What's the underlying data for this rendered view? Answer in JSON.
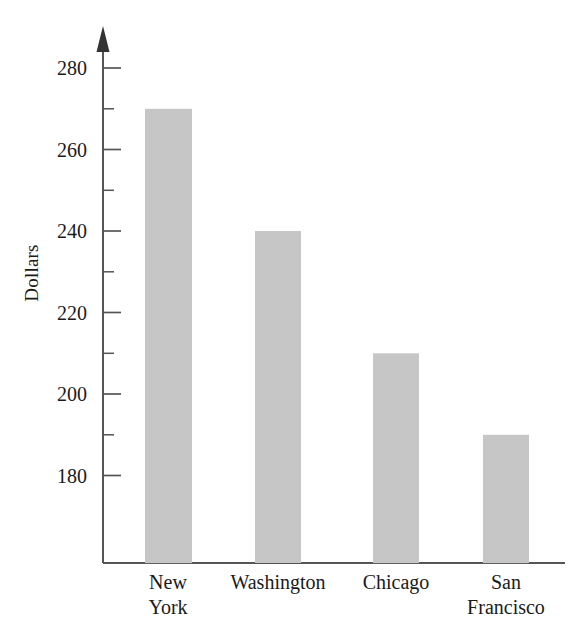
{
  "chart_data": {
    "type": "bar",
    "title": "",
    "subtitle": "",
    "xlabel": "",
    "ylabel": "Dollars",
    "categories": [
      "New York",
      "Washington",
      "Chicago",
      "San Francisco"
    ],
    "values": [
      270,
      240,
      210,
      190
    ],
    "ylim": [
      170,
      285
    ],
    "y_major_ticks": [
      180,
      200,
      220,
      240,
      260,
      280
    ],
    "y_minor_ticks": [
      190,
      210,
      230,
      250,
      270
    ],
    "y_tick_labels": [
      "180",
      "200",
      "220",
      "240",
      "260",
      "280"
    ],
    "grid": false,
    "legend": false,
    "legend_position": "none",
    "bar_color": "#c6c6c6",
    "axis_color": "#555555",
    "text_color": "#1a1a1a",
    "background_color": "#ffffff",
    "axis_arrow": true,
    "category_label_lines": [
      [
        "New",
        "York"
      ],
      [
        "Washington"
      ],
      [
        "Chicago"
      ],
      [
        "San",
        "Francisco"
      ]
    ]
  },
  "axis": {
    "y_title": "Dollars",
    "tick_280": "280",
    "tick_260": "260",
    "tick_240": "240",
    "tick_220": "220",
    "tick_200": "200",
    "tick_180": "180"
  },
  "categories": {
    "c0_line0": "New",
    "c0_line1": "York",
    "c1_line0": "Washington",
    "c2_line0": "Chicago",
    "c3_line0": "San",
    "c3_line1": "Francisco"
  }
}
